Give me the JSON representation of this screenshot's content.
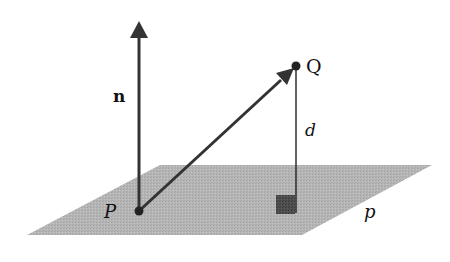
{
  "diagram": {
    "colors": {
      "plane": "#b4b4b4",
      "plane_texture": "#9e9e9e",
      "arrow": "#333333",
      "line": "#222222",
      "right_angle_marker": "#4a4a4a"
    },
    "plane": {
      "label": "p",
      "corners": [
        [
          160,
          165
        ],
        [
          432,
          165
        ],
        [
          302,
          235
        ],
        [
          27,
          235
        ]
      ]
    },
    "points": [
      {
        "name": "P",
        "label": "P",
        "x": 139,
        "y": 211
      },
      {
        "name": "Q",
        "label": "Q",
        "x": 296,
        "y": 66
      }
    ],
    "vectors": [
      {
        "name": "normal",
        "label": "n",
        "from": [
          139,
          211
        ],
        "to": [
          139,
          22
        ]
      },
      {
        "name": "PQ",
        "label": "",
        "from": [
          139,
          211
        ],
        "to": [
          296,
          66
        ]
      }
    ],
    "segments": [
      {
        "name": "distance",
        "label": "d",
        "from": [
          296,
          66
        ],
        "to": [
          296,
          212
        ]
      }
    ],
    "right_angle_marker": {
      "x": 276,
      "y": 195,
      "size": 19
    },
    "labels": {
      "n": "n",
      "P": "P",
      "Q": "Q",
      "d": "d",
      "p": "p"
    }
  }
}
